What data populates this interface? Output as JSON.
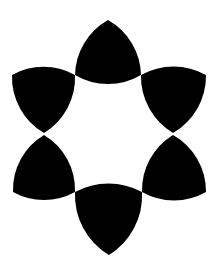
{
  "figure": {
    "background": "#ffffff",
    "fill": "#000000",
    "arc_radius": 65,
    "shapes": [
      {
        "name": "top",
        "points": [
          [
            108,
            20
          ],
          [
            75,
            75
          ],
          [
            141,
            75
          ]
        ]
      },
      {
        "name": "upper-left",
        "points": [
          [
            12,
            75
          ],
          [
            75,
            75
          ],
          [
            44,
            133
          ]
        ]
      },
      {
        "name": "upper-right",
        "points": [
          [
            141,
            75
          ],
          [
            206,
            75
          ],
          [
            173,
            133
          ]
        ]
      },
      {
        "name": "lower-left",
        "points": [
          [
            44,
            135
          ],
          [
            75,
            192
          ],
          [
            13,
            192
          ]
        ]
      },
      {
        "name": "lower-right",
        "points": [
          [
            173,
            135
          ],
          [
            206,
            192
          ],
          [
            142,
            192
          ]
        ]
      },
      {
        "name": "bottom",
        "points": [
          [
            75,
            192
          ],
          [
            142,
            192
          ],
          [
            109,
            255
          ]
        ]
      }
    ]
  }
}
